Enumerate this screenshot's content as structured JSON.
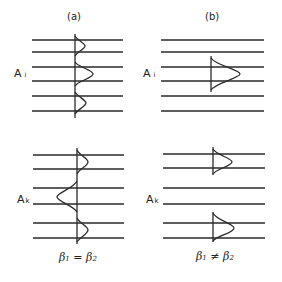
{
  "panels": [
    {
      "title": "(a)",
      "label_top": {
        "main": "A",
        "sub": "i"
      },
      "label_bottom": {
        "main": "A",
        "sub": "k"
      },
      "caption": {
        "b1": "β",
        "s1": "1",
        "op": "=",
        "b2": "β",
        "s2": "2"
      }
    },
    {
      "title": "(b)",
      "label_top": {
        "main": "A",
        "sub": "i"
      },
      "label_bottom": {
        "main": "A",
        "sub": "k"
      },
      "caption": {
        "b1": "β",
        "s1": "1",
        "op": "≠",
        "b2": "β",
        "s2": "2"
      }
    }
  ],
  "colors": {
    "line": "#2a2a2a",
    "background": "#ffffff"
  }
}
